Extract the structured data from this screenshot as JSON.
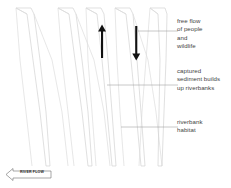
{
  "diagram": {
    "background_color": "#ffffff",
    "channel_stroke_color": "#d2d2d2",
    "braid_stroke_color": "#dcdcdc",
    "arrow_color": "#111111",
    "leader_line_color": "#9a9a9a",
    "text_color": "#3f3f3f"
  },
  "annotations": [
    {
      "id": "free-flow",
      "text": "free flow\nof people\nand\nwildlife"
    },
    {
      "id": "sediment",
      "text": "captured\nsediment builds\nup riverbanks"
    },
    {
      "id": "habitat",
      "text": "riverbank\nhabitat"
    }
  ],
  "flow_arrows": [
    {
      "id": "upstream-arrow",
      "direction": "up"
    },
    {
      "id": "downstream-arrow",
      "direction": "down"
    }
  ],
  "flow_banner": {
    "label": "RIVER FLOW",
    "direction": "left"
  }
}
